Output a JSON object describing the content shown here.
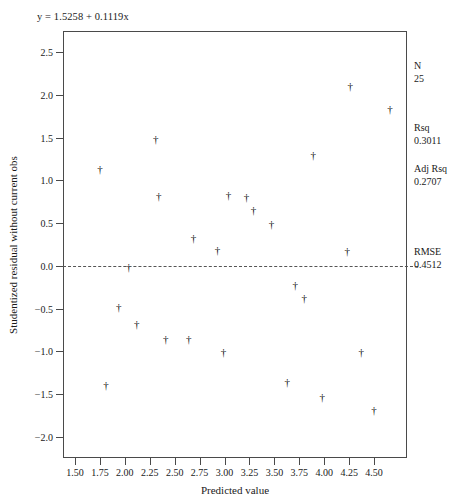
{
  "chart_data": {
    "type": "scatter",
    "title": "",
    "equation": "y = 1.5258 + 0.1119x",
    "xlabel": "Predicted value",
    "ylabel": "Studentized residual without current obs",
    "xlim": [
      1.38,
      4.83
    ],
    "ylim": [
      -2.25,
      2.75
    ],
    "grid": false,
    "legend": "none",
    "marker": "dagger",
    "reference_line": {
      "orientation": "horizontal",
      "y": 0.0,
      "style": "dashed"
    },
    "xticks": [
      "1.50",
      "1.75",
      "2.00",
      "2.25",
      "2.50",
      "2.75",
      "3.00",
      "3.25",
      "3.50",
      "3.75",
      "4.00",
      "4.25",
      "4.50"
    ],
    "xtick_values": [
      1.5,
      1.75,
      2.0,
      2.25,
      2.5,
      2.75,
      3.0,
      3.25,
      3.5,
      3.75,
      4.0,
      4.25,
      4.5
    ],
    "yticks": [
      "2.5",
      "2.0",
      "1.5",
      "1.0",
      "0.5",
      "0.0",
      "-0.5",
      "-1.0",
      "-1.5",
      "-2.0"
    ],
    "ytick_values": [
      2.5,
      2.0,
      1.5,
      1.0,
      0.5,
      0.0,
      -0.5,
      -1.0,
      -1.5,
      -2.0
    ],
    "points": [
      {
        "x": 1.74,
        "y": 1.15
      },
      {
        "x": 1.8,
        "y": -1.38
      },
      {
        "x": 1.93,
        "y": -0.47
      },
      {
        "x": 2.03,
        "y": 0.0
      },
      {
        "x": 2.11,
        "y": -0.67
      },
      {
        "x": 2.3,
        "y": 1.5
      },
      {
        "x": 2.33,
        "y": 0.83
      },
      {
        "x": 2.4,
        "y": -0.85
      },
      {
        "x": 2.63,
        "y": -0.85
      },
      {
        "x": 2.68,
        "y": 0.34
      },
      {
        "x": 2.92,
        "y": 0.2
      },
      {
        "x": 2.98,
        "y": -1.0
      },
      {
        "x": 3.03,
        "y": 0.84
      },
      {
        "x": 3.21,
        "y": 0.82
      },
      {
        "x": 3.28,
        "y": 0.66
      },
      {
        "x": 3.46,
        "y": 0.5
      },
      {
        "x": 3.62,
        "y": -1.35
      },
      {
        "x": 3.7,
        "y": -0.21
      },
      {
        "x": 3.79,
        "y": -0.36
      },
      {
        "x": 3.88,
        "y": 1.31
      },
      {
        "x": 3.97,
        "y": -1.52
      },
      {
        "x": 4.22,
        "y": 0.18
      },
      {
        "x": 4.25,
        "y": 2.12
      },
      {
        "x": 4.36,
        "y": -1.0
      },
      {
        "x": 4.49,
        "y": -1.68
      },
      {
        "x": 4.65,
        "y": 1.85
      }
    ]
  },
  "stats": {
    "n": {
      "label": "N",
      "value": "25"
    },
    "rsq": {
      "label": "Rsq",
      "value": "0.3011"
    },
    "adj_rsq": {
      "label": "Adj Rsq",
      "value": "0.2707"
    },
    "rmse": {
      "label": "RMSE",
      "value": "0.4512"
    }
  }
}
